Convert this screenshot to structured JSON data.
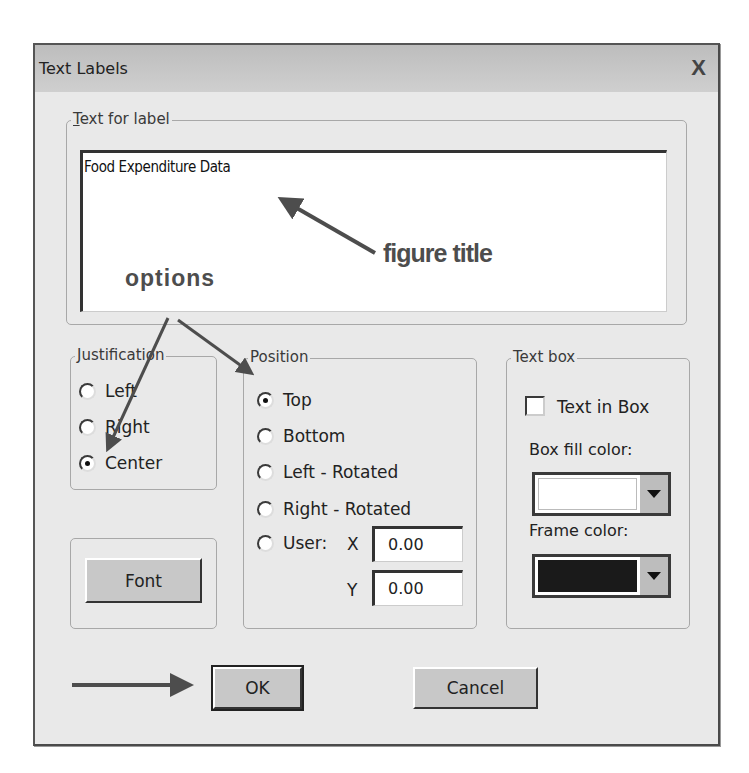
{
  "dialog": {
    "title": "Text Labels",
    "close_label": "X"
  },
  "text_for_label": {
    "group_label": "Text for label",
    "mnemonic": "T",
    "group_label_rest": "ext for label",
    "value": "Food Expenditure Data"
  },
  "justification": {
    "group_label": "Justification",
    "options": [
      {
        "label": "Left",
        "checked": false
      },
      {
        "label": "Right",
        "checked": false
      },
      {
        "label": "Center",
        "checked": true
      }
    ]
  },
  "position": {
    "group_label": "Position",
    "options": [
      {
        "label": "Top",
        "checked": true
      },
      {
        "label": "Bottom",
        "checked": false
      },
      {
        "label": "Left - Rotated",
        "checked": false
      },
      {
        "label": "Right - Rotated",
        "checked": false
      },
      {
        "label": "User:",
        "checked": false
      }
    ],
    "x_label": "X",
    "x_value": "0.00",
    "y_label": "Y",
    "y_value": "0.00"
  },
  "text_box": {
    "group_label": "Text box",
    "text_in_box_label": "Text in Box",
    "text_in_box_checked": false,
    "box_fill_label": "Box fill color:",
    "box_fill_color": "#ffffff",
    "frame_label": "Frame color:",
    "frame_color": "#1a1a1a"
  },
  "buttons": {
    "font": "Font",
    "ok": "OK",
    "cancel": "Cancel"
  },
  "annotations": {
    "figure_title": "figure title",
    "options": "options",
    "arrow_color": "#4d4d4d"
  }
}
